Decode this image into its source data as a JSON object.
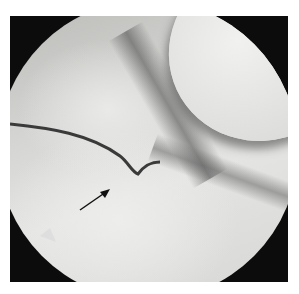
{
  "image": {
    "description": "Grayscale arthroscopic view inside a circular field of view with a black arrow pointing to a tear line",
    "colors": {
      "background": "#0c0c0c",
      "tissue_light": "#e9e9e7",
      "tissue_mid": "#c8c8c6",
      "tear_line": "#3a3a3a",
      "arrow": "#111111"
    },
    "annotation": {
      "type": "arrow",
      "direction": "up-right",
      "label": ""
    }
  }
}
